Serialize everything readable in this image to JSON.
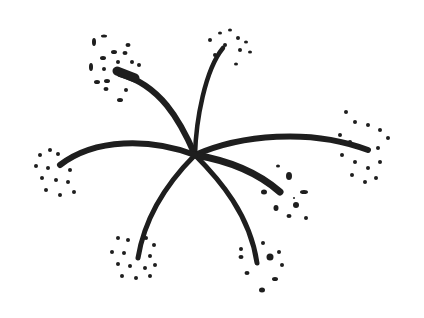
{
  "image": {
    "subject": "ink sketch of an umbel flower head with six curved rays ending in dotted clusters",
    "colors": {
      "ink": "#1e1e1e",
      "background": "#ffffff"
    },
    "center": [
      195,
      155
    ],
    "rays": [
      {
        "name": "upper-left",
        "end": [
          122,
          76
        ]
      },
      {
        "name": "top",
        "end": [
          223,
          50
        ]
      },
      {
        "name": "right",
        "end": [
          370,
          150
        ]
      },
      {
        "name": "lower-right-short",
        "end": [
          270,
          192
        ]
      },
      {
        "name": "bottom-right",
        "end": [
          257,
          263
        ]
      },
      {
        "name": "bottom-left",
        "end": [
          138,
          258
        ]
      },
      {
        "name": "left",
        "end": [
          62,
          165
        ]
      }
    ]
  }
}
